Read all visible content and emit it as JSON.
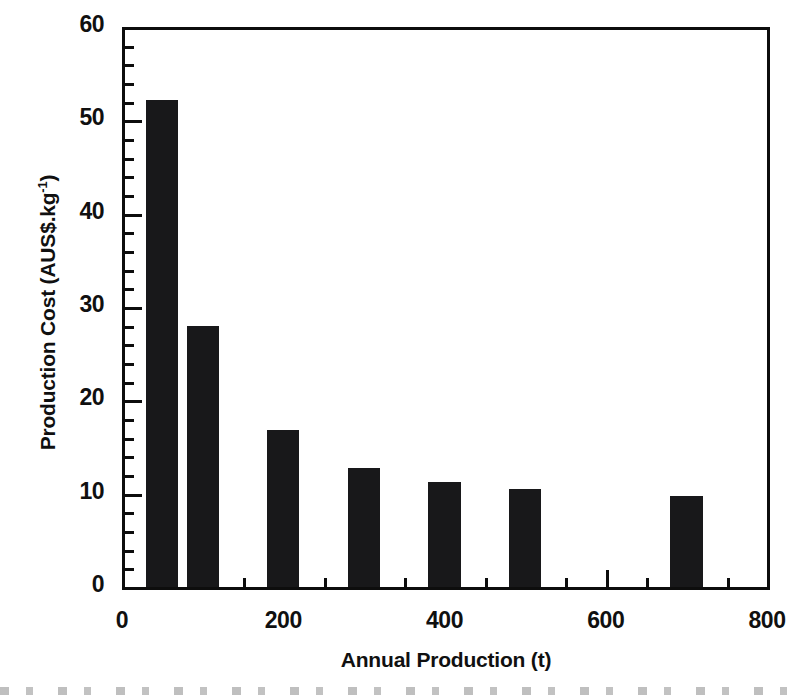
{
  "chart_data": {
    "type": "bar",
    "title": "",
    "xlabel": "Annual Production (t)",
    "ylabel": "Production Cost (AUS$.kg",
    "ylabel_superscript": "-1",
    "ylabel_suffix": ")",
    "x": [
      50,
      100,
      200,
      300,
      400,
      500,
      700
    ],
    "values": [
      52.2,
      28.0,
      16.8,
      12.7,
      11.3,
      10.5,
      9.8
    ],
    "bar_width_units": 40,
    "xlim": [
      0,
      800
    ],
    "ylim": [
      0,
      60
    ],
    "xticks": [
      0,
      200,
      400,
      600,
      800
    ],
    "xtick_labels": [
      "0",
      "200",
      "400",
      "600",
      "800"
    ],
    "x_minor_tick_step": 50,
    "yticks": [
      0,
      10,
      20,
      30,
      40,
      50,
      60
    ],
    "ytick_labels": [
      "0",
      "10",
      "20",
      "30",
      "40",
      "50",
      "60"
    ],
    "y_minor_tick_step": 2,
    "grid": false,
    "legend": null,
    "bar_color": "#18181a",
    "axis_color": "#0d0d0d",
    "background_color": "#ffffff",
    "bars": [
      {
        "label": "50",
        "x": 50,
        "value": 52.2
      },
      {
        "label": "100",
        "x": 100,
        "value": 28.0
      },
      {
        "label": "200",
        "x": 200,
        "value": 16.8
      },
      {
        "label": "300",
        "x": 300,
        "value": 12.7
      },
      {
        "label": "400",
        "x": 400,
        "value": 11.3
      },
      {
        "label": "500",
        "x": 500,
        "value": 10.5
      },
      {
        "label": "700",
        "x": 700,
        "value": 9.8
      }
    ]
  }
}
